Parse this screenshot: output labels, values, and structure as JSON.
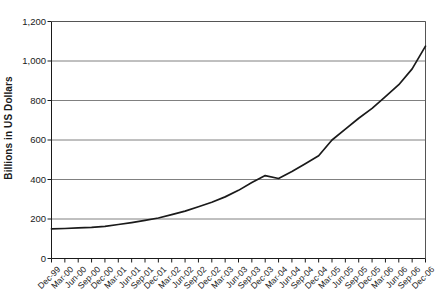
{
  "chart_data": {
    "type": "line",
    "title": "",
    "xlabel": "",
    "ylabel": "Billions in US Dollars",
    "ylim": [
      0,
      1200
    ],
    "ytick_labels": [
      "1,200",
      "1,000",
      "800",
      "600",
      "400",
      "200",
      "0"
    ],
    "ytick_values": [
      1200,
      1000,
      800,
      600,
      400,
      200,
      0
    ],
    "grid": true,
    "grid_axis": "y",
    "legend": "none",
    "line_color": "#1a1a1a",
    "categories": [
      "Dec-99",
      "Mar-00",
      "Jun-00",
      "Sep-00",
      "Dec-00",
      "Mar-01",
      "Jun-01",
      "Sep-01",
      "Dec-01",
      "Mar-02",
      "Jun-02",
      "Sep-02",
      "Dec-02",
      "Mar-03",
      "Jun-03",
      "Sep-03",
      "Dec-03",
      "Mar-04",
      "Jun-04",
      "Sep-04",
      "Dec-04",
      "Mar-05",
      "Jun-05",
      "Sep-05",
      "Dec-05",
      "Mar-06",
      "Jun-06",
      "Sep-06",
      "Dec-06"
    ],
    "values": [
      150,
      152,
      155,
      158,
      163,
      172,
      182,
      193,
      205,
      222,
      240,
      262,
      285,
      312,
      345,
      385,
      420,
      405,
      440,
      480,
      520,
      600,
      655,
      710,
      760,
      820,
      880,
      960,
      1075
    ],
    "series": [
      {
        "name": "Billions in US Dollars",
        "values": [
          150,
          152,
          155,
          158,
          163,
          172,
          182,
          193,
          205,
          222,
          240,
          262,
          285,
          312,
          345,
          385,
          420,
          405,
          440,
          480,
          520,
          600,
          655,
          710,
          760,
          820,
          880,
          960,
          1075
        ]
      }
    ]
  },
  "axis": {
    "y_title": "Billions in US Dollars"
  }
}
